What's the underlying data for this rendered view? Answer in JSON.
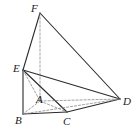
{
  "figure": {
    "kind": "3d-geometry-diagram",
    "canvas": {
      "width": 136,
      "height": 140
    },
    "background_color": "#ffffff",
    "stroke_color": "#2b2b2b",
    "hidden_stroke_color": "#8a8a8a",
    "label_color": "#1a1a1a"
  },
  "vertices": [
    {
      "name": "A",
      "label": "A",
      "x": 40,
      "y": 101,
      "label_x": 36,
      "label_y": 94,
      "hidden": true
    },
    {
      "name": "B",
      "label": "B",
      "x": 23,
      "y": 114,
      "label_x": 15,
      "label_y": 115,
      "hidden": false
    },
    {
      "name": "C",
      "label": "C",
      "x": 67,
      "y": 112,
      "label_x": 63,
      "label_y": 116,
      "hidden": false
    },
    {
      "name": "D",
      "label": "D",
      "x": 120,
      "y": 99,
      "label_x": 123,
      "label_y": 96,
      "hidden": false
    },
    {
      "name": "E",
      "label": "E",
      "x": 23,
      "y": 70,
      "label_x": 13,
      "label_y": 63,
      "hidden": false
    },
    {
      "name": "F",
      "label": "F",
      "x": 40,
      "y": 13,
      "label_x": 31,
      "label_y": 3,
      "hidden": false
    }
  ],
  "edges": [
    {
      "name": "edge-F-E",
      "from": "F",
      "to": "E",
      "style": "solid"
    },
    {
      "name": "edge-F-D",
      "from": "F",
      "to": "D",
      "style": "solid"
    },
    {
      "name": "edge-F-A",
      "from": "F",
      "to": "A",
      "style": "dashed"
    },
    {
      "name": "edge-E-B",
      "from": "E",
      "to": "B",
      "style": "solid"
    },
    {
      "name": "edge-E-C",
      "from": "E",
      "to": "C",
      "style": "solid"
    },
    {
      "name": "edge-E-D",
      "from": "E",
      "to": "D",
      "style": "solid"
    },
    {
      "name": "edge-E-A",
      "from": "E",
      "to": "A",
      "style": "dashed"
    },
    {
      "name": "edge-B-C",
      "from": "B",
      "to": "C",
      "style": "solid"
    },
    {
      "name": "edge-C-D",
      "from": "C",
      "to": "D",
      "style": "solid"
    },
    {
      "name": "edge-B-D",
      "from": "B",
      "to": "D",
      "style": "dashed"
    },
    {
      "name": "edge-A-D",
      "from": "A",
      "to": "D",
      "style": "dashed"
    },
    {
      "name": "edge-A-B",
      "from": "A",
      "to": "B",
      "style": "dashed"
    },
    {
      "name": "edge-A-C",
      "from": "A",
      "to": "C",
      "style": "dashed"
    }
  ]
}
